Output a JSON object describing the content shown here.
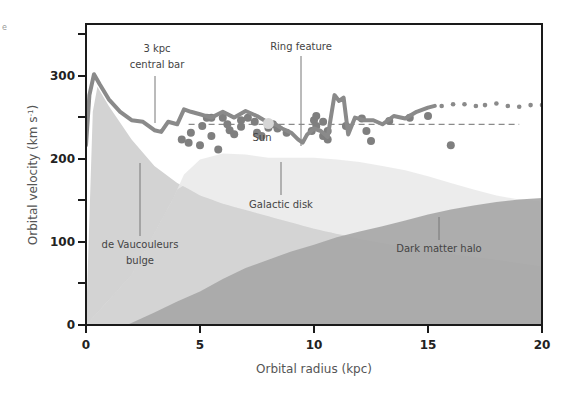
{
  "chart_data": {
    "type": "area",
    "title": "",
    "xlabel": "Orbital radius (kpc)",
    "ylabel": "Orbital velocity (km s⁻¹)",
    "xlim": [
      0,
      20
    ],
    "ylim": [
      0,
      360
    ],
    "xticks": [
      0,
      5,
      10,
      15,
      20
    ],
    "yticks": [
      0,
      100,
      200,
      300
    ],
    "yminor_ticks": [
      50,
      150,
      250,
      350
    ],
    "grid": false,
    "legend": "none (inline annotations)",
    "series": [
      {
        "name": "Observed rotation curve",
        "kind": "line",
        "color": "#8a8a8a",
        "x": [
          0.0,
          0.15,
          0.35,
          0.6,
          1.0,
          1.5,
          2.0,
          2.5,
          3.0,
          3.3,
          3.6,
          4.0,
          4.3,
          4.6,
          5.0,
          5.5,
          6.0,
          6.5,
          7.0,
          7.5,
          8.0,
          8.3,
          8.6,
          9.0,
          9.3,
          9.5,
          9.7,
          10.0,
          10.3,
          10.6,
          10.9,
          11.1,
          11.3,
          11.5,
          11.8,
          12.2,
          12.6,
          13.0,
          13.5,
          14.0,
          14.5,
          15.0,
          15.3
        ],
        "y": [
          215,
          275,
          300,
          288,
          270,
          255,
          245,
          243,
          233,
          231,
          243,
          240,
          258,
          255,
          252,
          248,
          255,
          248,
          256,
          250,
          242,
          240,
          235,
          230,
          222,
          218,
          228,
          235,
          232,
          225,
          275,
          268,
          272,
          228,
          248,
          245,
          245,
          240,
          250,
          247,
          255,
          260,
          262
        ]
      },
      {
        "name": "Outer rotation curve (extrapolated)",
        "kind": "dotted",
        "color": "#8a8a8a",
        "x": [
          15.6,
          16.1,
          16.6,
          17.1,
          17.5,
          18.0,
          18.5,
          19.0,
          19.5,
          20.0
        ],
        "y": [
          262,
          264,
          264,
          262,
          263,
          265,
          262,
          261,
          263,
          263
        ]
      },
      {
        "name": "Reference velocity",
        "kind": "dashed",
        "color": "#8a8a8a",
        "x": [
          4.5,
          19.0
        ],
        "y": [
          240,
          240
        ]
      },
      {
        "name": "Measured points",
        "kind": "scatter",
        "color": "#7f7f7f",
        "points": [
          [
            4.2,
            222
          ],
          [
            4.5,
            218
          ],
          [
            4.6,
            230
          ],
          [
            5.0,
            215
          ],
          [
            5.1,
            238
          ],
          [
            5.3,
            248
          ],
          [
            5.5,
            226
          ],
          [
            5.5,
            248
          ],
          [
            5.8,
            210
          ],
          [
            6.0,
            248
          ],
          [
            6.2,
            240
          ],
          [
            6.3,
            233
          ],
          [
            6.5,
            228
          ],
          [
            6.8,
            245
          ],
          [
            6.8,
            237
          ],
          [
            7.1,
            248
          ],
          [
            7.4,
            243
          ],
          [
            7.5,
            230
          ],
          [
            7.7,
            226
          ],
          [
            8.0,
            236
          ],
          [
            8.2,
            240
          ],
          [
            8.4,
            235
          ],
          [
            8.8,
            230
          ],
          [
            9.9,
            232
          ],
          [
            10.0,
            245
          ],
          [
            10.1,
            250
          ],
          [
            10.1,
            238
          ],
          [
            10.4,
            243
          ],
          [
            10.4,
            226
          ],
          [
            10.6,
            232
          ],
          [
            10.6,
            222
          ],
          [
            11.4,
            238
          ],
          [
            12.1,
            247
          ],
          [
            12.3,
            232
          ],
          [
            12.5,
            220
          ],
          [
            13.3,
            244
          ],
          [
            14.2,
            248
          ],
          [
            15.0,
            250
          ],
          [
            16.0,
            215
          ]
        ]
      },
      {
        "name": "Sun",
        "kind": "marker",
        "color": "#d6d6d6",
        "x": [
          8.0
        ],
        "y": [
          241
        ]
      },
      {
        "name": "de Vaucouleurs bulge",
        "kind": "area",
        "color": "#d3d3d3",
        "x": [
          0.0,
          0.3,
          0.5,
          1.0,
          2.0,
          3.0,
          4.0,
          5.0,
          6.0,
          8.0,
          10.0,
          12.0,
          14.0,
          16.0,
          18.0,
          20.0
        ],
        "y": [
          0,
          255,
          285,
          262,
          222,
          190,
          170,
          155,
          145,
          130,
          115,
          103,
          93,
          85,
          78,
          70
        ]
      },
      {
        "name": "Galactic disk",
        "kind": "area",
        "color": "#e9e9e9",
        "x": [
          0.0,
          2.0,
          3.0,
          3.8,
          4.3,
          5.0,
          6.0,
          7.0,
          8.0,
          9.0,
          10.0,
          11.0,
          12.0,
          13.0,
          14.0,
          15.0,
          16.0,
          17.0,
          18.0,
          19.0,
          20.0
        ],
        "y": [
          0,
          60,
          110,
          150,
          180,
          198,
          205,
          204,
          200,
          200,
          200,
          198,
          195,
          190,
          185,
          178,
          170,
          162,
          155,
          150,
          148
        ]
      },
      {
        "name": "Dark matter halo",
        "kind": "area",
        "color": "#a6a6a6",
        "x": [
          0.0,
          1.8,
          3.0,
          4.0,
          5.0,
          6.0,
          7.0,
          8.0,
          9.0,
          10.0,
          11.0,
          12.0,
          13.0,
          14.0,
          15.0,
          16.0,
          17.0,
          18.0,
          19.0,
          20.0
        ],
        "y": [
          0,
          0,
          15,
          28,
          40,
          55,
          68,
          78,
          88,
          96,
          105,
          112,
          118,
          125,
          132,
          138,
          143,
          147,
          150,
          152
        ]
      }
    ],
    "annotations": [
      {
        "text": "3 kpc",
        "text2": "central bar",
        "x": 3.0,
        "y": 232
      },
      {
        "text": "Ring feature",
        "x": 9.5,
        "y": 218
      },
      {
        "text": "Sun",
        "x": 8.0,
        "y": 224
      },
      {
        "text": "Galactic disk",
        "x": 8.6,
        "y": 180
      },
      {
        "text": "de Vaucouleurs",
        "text2": "bulge",
        "x": 2.3,
        "y": 160
      },
      {
        "text": "Dark matter halo",
        "x": 15.6,
        "y": 135
      }
    ]
  },
  "labels": {
    "xlabel": "Orbital radius (kpc)",
    "ylabel_main": "Orbital velocity (km s",
    "ylabel_sup": "-1",
    "ylabel_close": ")",
    "xticks": [
      "0",
      "5",
      "10",
      "15",
      "20"
    ],
    "yticks": [
      "0",
      "100",
      "200",
      "300"
    ],
    "annot_bar_1": "3 kpc",
    "annot_bar_2": "central bar",
    "annot_ring": "Ring feature",
    "annot_sun": "Sun",
    "annot_disk": "Galactic disk",
    "annot_bulge_1": "de Vaucouleurs",
    "annot_bulge_2": "bulge",
    "annot_halo": "Dark matter halo",
    "corner_mark": "e"
  }
}
